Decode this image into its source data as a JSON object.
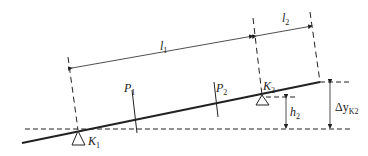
{
  "diagram": {
    "labels": {
      "l1": "l",
      "l1_sub": "1",
      "l2": "l",
      "l2_sub": "2",
      "p1": "P",
      "p1_sub": "1",
      "p2": "P",
      "p2_sub": "2",
      "k1": "K",
      "k1_sub": "1",
      "k2": "K",
      "k2_sub": "2",
      "h2": "h",
      "h2_sub": "2",
      "dy": "Δy",
      "dy_sub": "K2"
    },
    "colors": {
      "line": "#222222",
      "background": "#ffffff"
    }
  }
}
